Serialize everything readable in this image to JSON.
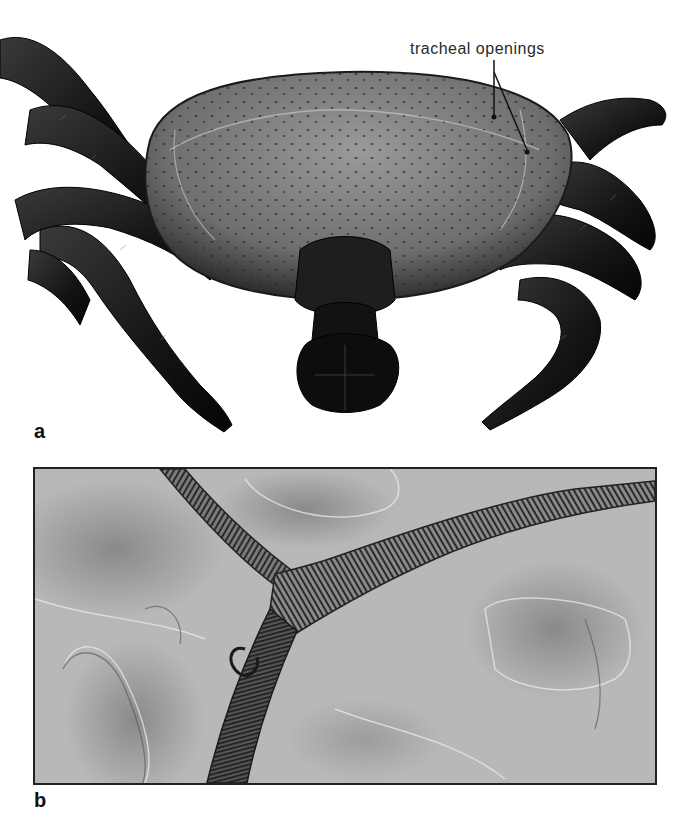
{
  "figure": {
    "panels": [
      {
        "id": "a",
        "label": "a",
        "description": "Scanning electron micrograph of a tick (dorsal-anterior view) showing body, legs and mouthparts",
        "annotations": [
          {
            "text": "tracheal openings",
            "pointers": 2
          }
        ]
      },
      {
        "id": "b",
        "label": "b",
        "description": "Light micrograph of branching tracheal tubes with spiral ridges"
      }
    ],
    "colors": {
      "background": "#ffffff",
      "specimen_dark": "#1a1a1a",
      "body_gray": "#8a8a8a",
      "micrograph_gray": "#b4b4b4",
      "trachea_dark": "#3a3a3a",
      "border": "#222222"
    }
  }
}
